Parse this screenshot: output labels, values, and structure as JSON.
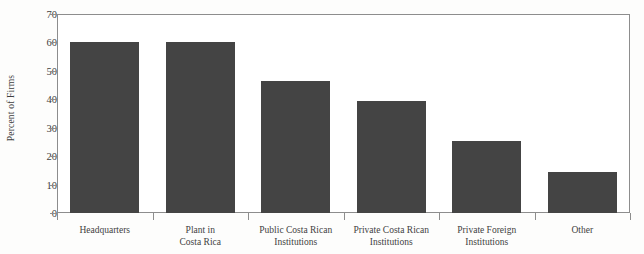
{
  "chart_data": {
    "type": "bar",
    "title": "",
    "xlabel": "",
    "ylabel": "Percent of Firms",
    "ylim": [
      0,
      70
    ],
    "yticks": [
      0,
      10,
      20,
      30,
      40,
      50,
      60,
      70
    ],
    "grid": false,
    "legend": null,
    "bar_color": "#444444",
    "axis_color": "#8d8d8d",
    "categories": [
      "Headquarters",
      "Plant in Costa Rica",
      "Public Costa Rican Institutions",
      "Private Costa Rican Institutions",
      "Private Foreign Institutions",
      "Other"
    ],
    "category_lines": [
      [
        "Headquarters",
        ""
      ],
      [
        "Plant in",
        "Costa Rica"
      ],
      [
        "Public Costa Rican",
        "Institutions"
      ],
      [
        "Private Costa Rican",
        "Institutions"
      ],
      [
        "Private Foreign",
        "Institutions"
      ],
      [
        "Other",
        ""
      ]
    ],
    "values": [
      60,
      60,
      46.5,
      39.5,
      25.5,
      14.5
    ]
  }
}
